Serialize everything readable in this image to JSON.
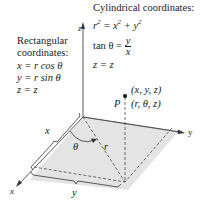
{
  "cylindrical": {
    "title": "Cylindrical coordinates:",
    "eq1_lhs": "r",
    "eq1_rhs": "= x",
    "eq1_plus": " + y",
    "sup": "2",
    "eq2_lhs": "tan θ =",
    "eq2_num": "y",
    "eq2_den": "x",
    "eq3": "z = z"
  },
  "rectangular": {
    "title_line1": "Rectangular",
    "title_line2": "coordinates:",
    "eq1": "x = r cos θ",
    "eq2": "y = r sin θ",
    "eq3": "z = z"
  },
  "axes": {
    "x": "x",
    "y": "y",
    "z": "z"
  },
  "point": {
    "label": "P",
    "rect": "(x, y, z)",
    "cyl": "(r, θ, z)"
  },
  "labels": {
    "theta": "θ",
    "r": "r",
    "brace_x": "x",
    "brace_y": "y"
  },
  "colors": {
    "plane": "#e4e4e4",
    "line": "#333333"
  }
}
